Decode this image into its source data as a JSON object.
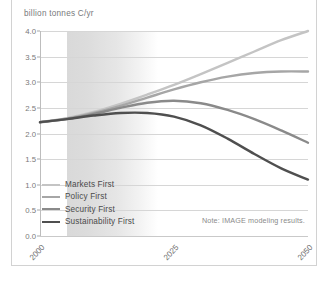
{
  "figure": {
    "title_fragment": "",
    "note": "Note: IMAGE modeling results."
  },
  "chart_data": {
    "type": "line",
    "title": "",
    "subtitle": "",
    "xlabel": "",
    "ylabel": "billion tonnes C/yr",
    "x": [
      2000,
      2005,
      2010,
      2015,
      2020,
      2025,
      2030,
      2035,
      2040,
      2045,
      2050
    ],
    "xlim": [
      2000,
      2050
    ],
    "ylim": [
      0.0,
      4.0
    ],
    "xticks": [
      2000,
      2025,
      2050
    ],
    "xtick_labels": [
      "2000",
      "2025",
      "2050"
    ],
    "yticks": [
      0.0,
      0.5,
      1.0,
      1.5,
      2.0,
      2.5,
      3.0,
      3.5,
      4.0
    ],
    "ytick_labels": [
      "0.0",
      "0.5",
      "1.0",
      "1.5",
      "2.0",
      "2.5",
      "3.0",
      "3.5",
      "4.0"
    ],
    "grid": true,
    "legend_position": "lower-left",
    "shaded_band": {
      "from": 2005,
      "to": 2014,
      "fade_to": 2022,
      "color": "#d9d9d9"
    },
    "series": [
      {
        "name": "Markets First",
        "color": "#c4c4c4",
        "width": 2.4,
        "values": [
          2.22,
          2.3,
          2.42,
          2.58,
          2.76,
          2.95,
          3.16,
          3.38,
          3.6,
          3.82,
          4.0
        ]
      },
      {
        "name": "Policy First",
        "color": "#a6a6a6",
        "width": 2.4,
        "values": [
          2.22,
          2.29,
          2.4,
          2.54,
          2.7,
          2.86,
          3.0,
          3.11,
          3.18,
          3.21,
          3.21
        ]
      },
      {
        "name": "Security First",
        "color": "#8a8a8a",
        "width": 2.4,
        "values": [
          2.22,
          2.28,
          2.38,
          2.5,
          2.6,
          2.64,
          2.59,
          2.46,
          2.28,
          2.06,
          1.82
        ]
      },
      {
        "name": "Sustainability First",
        "color": "#4f4f4f",
        "width": 2.4,
        "values": [
          2.22,
          2.28,
          2.35,
          2.4,
          2.4,
          2.33,
          2.16,
          1.9,
          1.6,
          1.32,
          1.1
        ]
      }
    ]
  },
  "legend": {
    "items": [
      {
        "label": "Markets First",
        "color": "#c4c4c4"
      },
      {
        "label": "Policy First",
        "color": "#a6a6a6"
      },
      {
        "label": "Security First",
        "color": "#8a8a8a"
      },
      {
        "label": "Sustainability First",
        "color": "#4f4f4f"
      }
    ]
  }
}
